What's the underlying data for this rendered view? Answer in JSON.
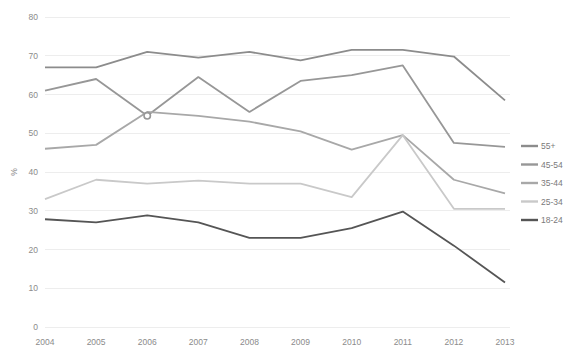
{
  "chart_data": {
    "type": "line",
    "title": "",
    "xlabel": "",
    "ylabel": "%",
    "x": [
      "2004",
      "2005",
      "2006",
      "2007",
      "2008",
      "2009",
      "2010",
      "2011",
      "2012",
      "2013"
    ],
    "ylim": [
      0,
      80
    ],
    "yticks": [
      0,
      10,
      20,
      30,
      40,
      50,
      60,
      70,
      80
    ],
    "grid": true,
    "legend_position": "right",
    "series": [
      {
        "name": "55+",
        "color": "#8c8c8c",
        "values": [
          67.0,
          67.0,
          71.0,
          69.5,
          71.0,
          68.8,
          71.5,
          71.5,
          69.8,
          58.5
        ]
      },
      {
        "name": "45-54",
        "color": "#979797",
        "values": [
          61.0,
          64.0,
          54.5,
          64.5,
          55.5,
          63.5,
          65.0,
          67.5,
          47.5,
          46.5
        ]
      },
      {
        "name": "35-44",
        "color": "#a8a8a8",
        "values": [
          46.0,
          47.0,
          55.5,
          54.5,
          53.0,
          50.5,
          45.8,
          49.5,
          38.0,
          34.5
        ]
      },
      {
        "name": "25-34",
        "color": "#c9c9c9",
        "values": [
          33.0,
          38.0,
          37.0,
          37.8,
          37.0,
          37.0,
          33.5,
          49.5,
          30.5,
          30.5
        ]
      },
      {
        "name": "18-24",
        "color": "#555555",
        "values": [
          27.8,
          27.0,
          28.8,
          27.0,
          23.0,
          23.0,
          25.5,
          29.8,
          21.0,
          11.5
        ]
      }
    ]
  },
  "legend": {
    "items": [
      {
        "label": "55+"
      },
      {
        "label": "45-54"
      },
      {
        "label": "35-44"
      },
      {
        "label": "25-34"
      },
      {
        "label": "18-24"
      }
    ]
  }
}
